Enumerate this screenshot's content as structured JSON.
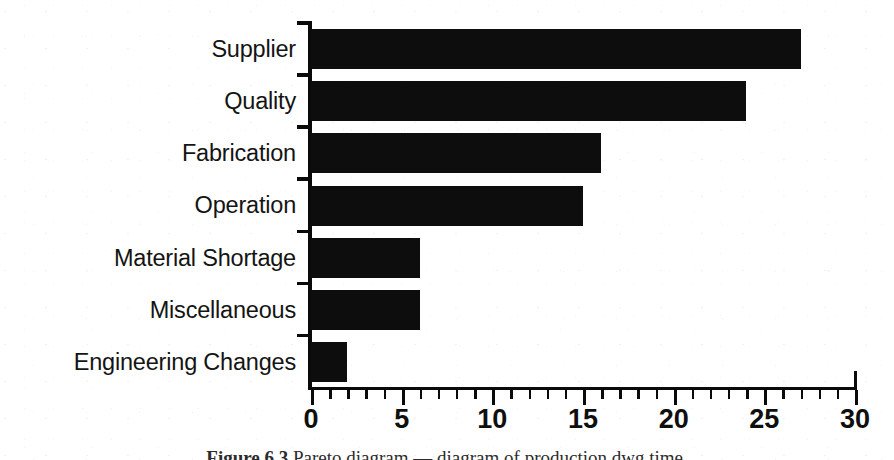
{
  "figure": {
    "caption_label": "Figure 6.3",
    "caption_text": "Pareto diagram — diagram of production dwg time.",
    "background_color": "#ffffff",
    "ink_color": "#0d0d0d"
  },
  "chart_data": {
    "type": "bar",
    "orientation": "horizontal",
    "title": "",
    "xlabel": "",
    "ylabel": "",
    "categories": [
      "Supplier",
      "Quality",
      "Fabrication",
      "Operation",
      "Material Shortage",
      "Miscellaneous",
      "Engineering Changes"
    ],
    "values": [
      27,
      24,
      16,
      15,
      6,
      6,
      2
    ],
    "xlim": [
      0,
      30
    ],
    "xticks": [
      0,
      5,
      10,
      15,
      20,
      25,
      30
    ],
    "xtick_labels": [
      "0",
      "5",
      "10",
      "15",
      "20",
      "25",
      "30"
    ],
    "minor_tick_interval": 1,
    "grid": false,
    "legend": null,
    "bar_color": "#0d0d0d",
    "axis_color": "#0a0a0a"
  }
}
